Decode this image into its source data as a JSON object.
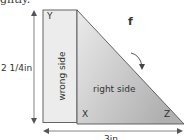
{
  "caption_fragment": "ghtly.",
  "figure": {
    "step_label": "f",
    "height_dimension": "2 1/4in",
    "width_dimension": "3in",
    "rectangle_label": "wrong side",
    "triangle_label": "right side",
    "corners": {
      "top_left": "Y",
      "bottom_left": "X",
      "bottom_right": "Z"
    },
    "colors": {
      "rectangle_fill": "#ececec",
      "triangle_fill_light": "#e6e6e6",
      "triangle_fill_dark": "#b4b4b4",
      "outline": "#555555",
      "arrow": "#444444"
    }
  }
}
